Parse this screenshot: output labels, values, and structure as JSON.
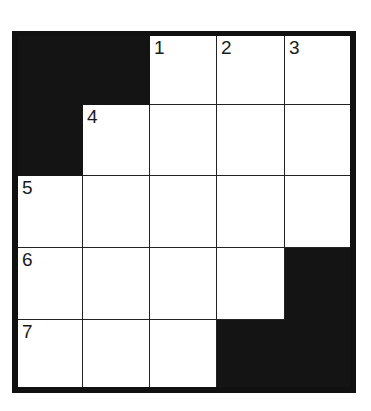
{
  "puzzle": {
    "rows": 5,
    "cols": 5,
    "colors": {
      "block": "#141414",
      "open": "#ffffff",
      "frame": "#111111"
    },
    "cells": [
      [
        {
          "black": true
        },
        {
          "black": true
        },
        {
          "black": false,
          "number": "1"
        },
        {
          "black": false,
          "number": "2"
        },
        {
          "black": false,
          "number": "3"
        }
      ],
      [
        {
          "black": true
        },
        {
          "black": false,
          "number": "4"
        },
        {
          "black": false
        },
        {
          "black": false
        },
        {
          "black": false
        }
      ],
      [
        {
          "black": false,
          "number": "5"
        },
        {
          "black": false
        },
        {
          "black": false
        },
        {
          "black": false
        },
        {
          "black": false
        }
      ],
      [
        {
          "black": false,
          "number": "6"
        },
        {
          "black": false
        },
        {
          "black": false
        },
        {
          "black": false
        },
        {
          "black": true
        }
      ],
      [
        {
          "black": false,
          "number": "7"
        },
        {
          "black": false
        },
        {
          "black": false
        },
        {
          "black": true
        },
        {
          "black": true
        }
      ]
    ]
  }
}
